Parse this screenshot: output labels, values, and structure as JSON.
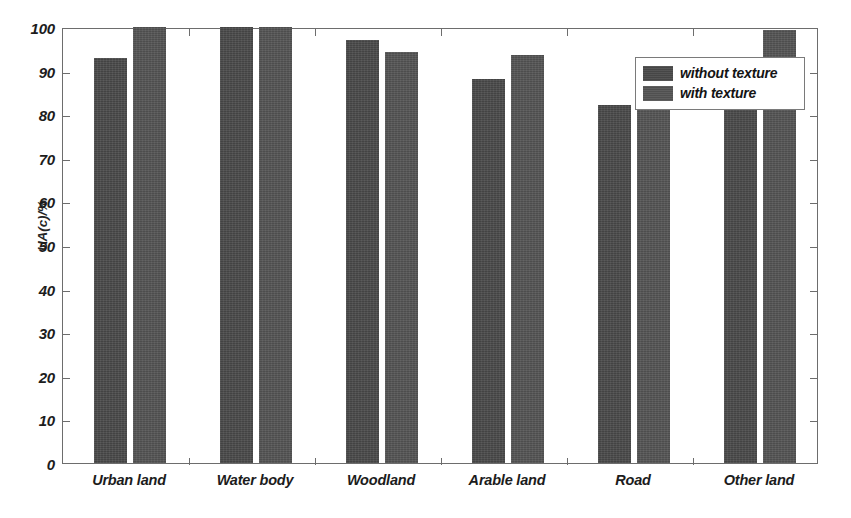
{
  "chart_data": {
    "type": "bar",
    "title": "",
    "subtitle": "",
    "xlabel": "",
    "ylabel": "UA(c)/%",
    "ylim": [
      0,
      100
    ],
    "ytick_step": 10,
    "yticks": [
      0,
      10,
      20,
      30,
      40,
      50,
      60,
      70,
      80,
      90,
      100
    ],
    "ytick_labels": [
      "0",
      "10",
      "20",
      "30",
      "40",
      "50",
      "60",
      "70",
      "80",
      "90",
      "100"
    ],
    "grid": false,
    "legend_position": "top-right",
    "categories": [
      "Urban land",
      "Water body",
      "Woodland",
      "Arable land",
      "Road",
      "Other land"
    ],
    "series": [
      {
        "name": "without texture",
        "color": "#4a4a4a",
        "values": [
          93,
          100,
          97,
          88,
          82,
          91
        ]
      },
      {
        "name": "with texture",
        "color": "#545454",
        "values": [
          100,
          100,
          94.3,
          93.6,
          85.4,
          99.4
        ]
      }
    ]
  },
  "legend": {
    "entries": [
      {
        "label": "without texture"
      },
      {
        "label": "with texture"
      }
    ]
  },
  "axes": {
    "y_title": "UA(c)/%"
  },
  "colors": {
    "series_without_texture": "#4a4a4a",
    "series_with_texture": "#545454",
    "axis": "#6d6d6d",
    "text": "#1c1c1c",
    "background": "#ffffff"
  }
}
